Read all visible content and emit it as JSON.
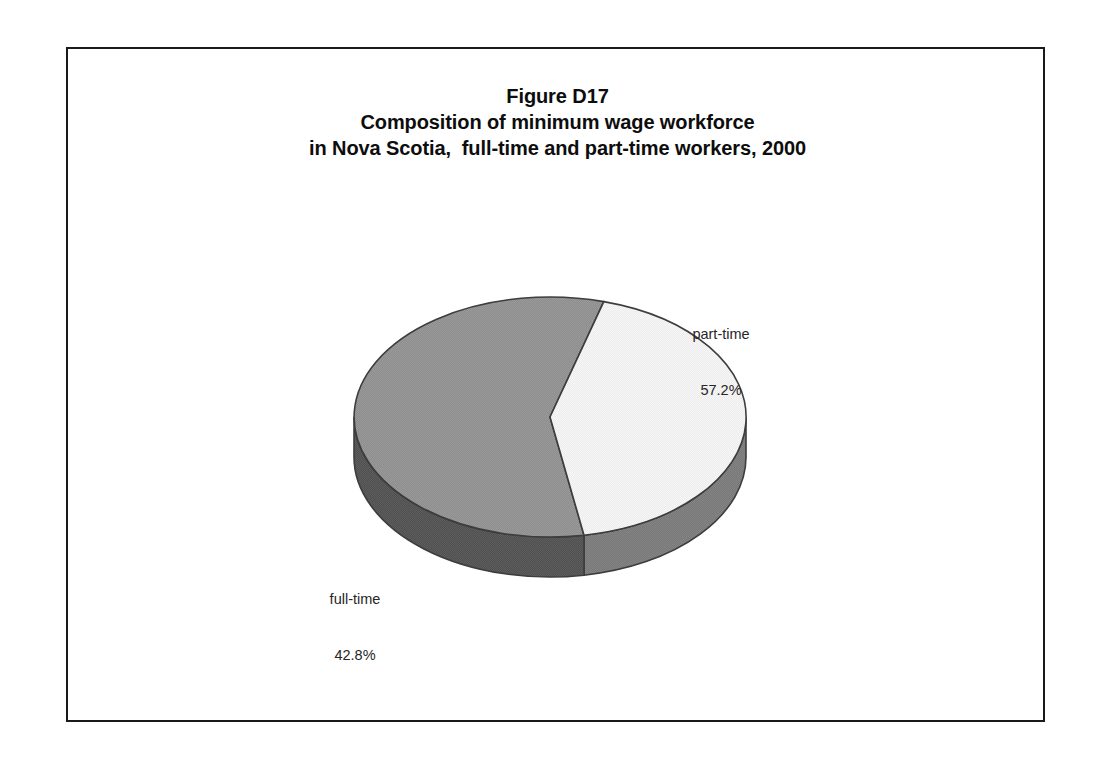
{
  "figure": {
    "title_lines": [
      "Figure D17",
      "Composition of minimum wage workforce",
      "in Nova Scotia,  full-time and part-time workers, 2000"
    ],
    "frame_color": "#1a1a1a",
    "background_color": "#ffffff"
  },
  "chart_data": {
    "type": "pie",
    "xlabel": "",
    "ylabel": "",
    "three_d": true,
    "legend_position": "none",
    "labels_inline": true,
    "categories": [
      "part-time",
      "full-time"
    ],
    "values": [
      57.2,
      42.8
    ],
    "value_suffix": "%",
    "slices": [
      {
        "name": "part-time",
        "value": 57.2,
        "value_text": "57.2%",
        "top_color": "#969696",
        "side_color": "#5a5a5a",
        "edge_color": "#3d3d3d"
      },
      {
        "name": "full-time",
        "value": 42.8,
        "value_text": "42.8%",
        "top_color": "#f5f5f5",
        "side_color": "#808080",
        "edge_color": "#3d3d3d"
      }
    ]
  },
  "labels": {
    "part_time": {
      "name": "part-time",
      "value": "57.2%"
    },
    "full_time": {
      "name": "full-time",
      "value": "42.8%"
    }
  }
}
